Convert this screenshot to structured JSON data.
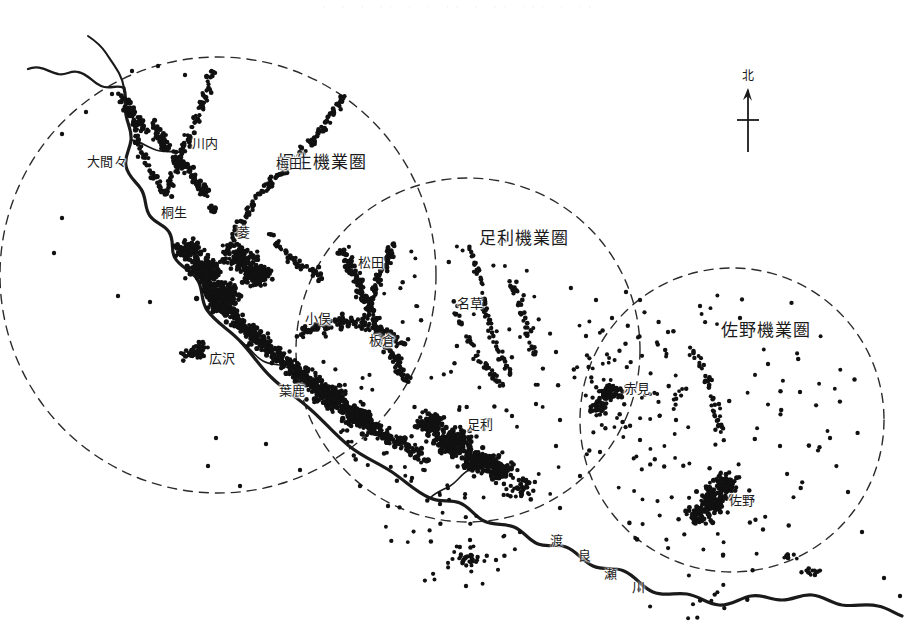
{
  "map": {
    "kind": "thematic-dot-distribution-map",
    "region_title": "橋生・足利・佐野機業圏",
    "background_color": "#ffffff",
    "ink_color": "#1a1a1a",
    "page_bleed_text": "· · ·   ·· · · ·· ·  ·· ···  · ··"
  },
  "compass": {
    "label": "北",
    "icon": "north-arrow-icon",
    "x": 748,
    "y": 60
  },
  "zones": [
    {
      "id": "kiryu",
      "label": "桐生機業圏",
      "label_x": 322,
      "label_y": 162,
      "circle": {
        "cx": 218,
        "cy": 275,
        "r": 218
      },
      "color": "#333333"
    },
    {
      "id": "ashikaga",
      "label": "足利機業圏",
      "label_x": 524,
      "label_y": 238,
      "circle": {
        "cx": 468,
        "cy": 350,
        "r": 172
      },
      "color": "#333333"
    },
    {
      "id": "sano",
      "label": "佐野機業圏",
      "label_x": 766,
      "label_y": 330,
      "circle": {
        "cx": 732,
        "cy": 420,
        "r": 152
      },
      "color": "#333333"
    }
  ],
  "places": [
    {
      "name": "大間々",
      "x": 107,
      "y": 161
    },
    {
      "name": "川内",
      "x": 205,
      "y": 143
    },
    {
      "name": "梅田",
      "x": 289,
      "y": 163
    },
    {
      "name": "桐生",
      "x": 174,
      "y": 212
    },
    {
      "name": "菱",
      "x": 244,
      "y": 232
    },
    {
      "name": "松田",
      "x": 371,
      "y": 262
    },
    {
      "name": "名草",
      "x": 470,
      "y": 303
    },
    {
      "name": "小俣",
      "x": 318,
      "y": 318
    },
    {
      "name": "板倉",
      "x": 382,
      "y": 340
    },
    {
      "name": "広沢",
      "x": 222,
      "y": 358
    },
    {
      "name": "葉鹿",
      "x": 292,
      "y": 390
    },
    {
      "name": "足利",
      "x": 480,
      "y": 424
    },
    {
      "name": "赤見",
      "x": 637,
      "y": 388
    },
    {
      "name": "佐野",
      "x": 742,
      "y": 500
    }
  ],
  "river": {
    "name": "渡良瀬川",
    "chars": [
      {
        "ch": "渡",
        "x": 556,
        "y": 539,
        "rot": 0
      },
      {
        "ch": "良",
        "x": 584,
        "y": 554,
        "rot": 0
      },
      {
        "ch": "瀬",
        "x": 610,
        "y": 572,
        "rot": 0
      },
      {
        "ch": "川",
        "x": 638,
        "y": 586,
        "rot": 0
      }
    ]
  },
  "legend_note": {
    "dot_meaning": "機業場（点）",
    "visible": false
  }
}
